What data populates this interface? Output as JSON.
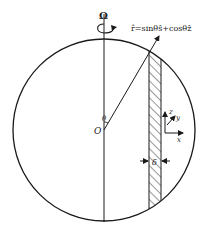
{
  "diagram": {
    "rotation_label": "Ω",
    "radial_vector_label": "r̂=sinθŝ+cosθẑ",
    "origin_label": "O",
    "angle_label": "θ",
    "thickness_label": "δ",
    "axes": {
      "x": "x",
      "y": "y",
      "z": "z"
    },
    "colors": {
      "stroke": "#1a1a1a",
      "background": "#ffffff"
    }
  }
}
